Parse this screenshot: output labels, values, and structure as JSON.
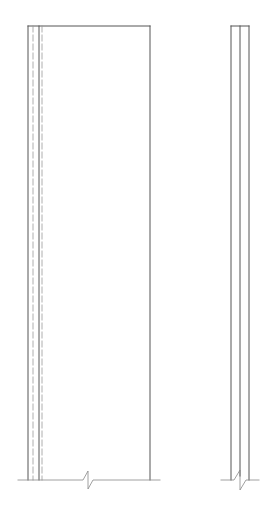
{
  "drawing": {
    "background": "#ffffff",
    "stroke_color": "#555555",
    "dash_color": "#999999",
    "ground_color": "#888888",
    "front_elevation": {
      "top": 26,
      "bottom": 480,
      "outer_left": 28,
      "dash_left_1": 33,
      "inner_solid": 39,
      "dash_left_2": 42,
      "right_edge": 150,
      "ground_x1": 18,
      "ground_x2": 160,
      "break_x": 88
    },
    "side_elevation": {
      "top": 26,
      "bottom": 480,
      "left": 231,
      "middle": 240,
      "right": 249,
      "ground_x1": 221,
      "ground_x2": 259,
      "break_x": 240
    }
  }
}
